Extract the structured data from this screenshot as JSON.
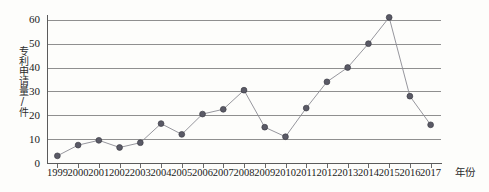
{
  "chart_data": {
    "type": "line",
    "title": "",
    "subtitle": "",
    "xlabel": "年份",
    "ylabel": "专利申请量/件",
    "categories": [
      "1999",
      "2000",
      "2001",
      "2002",
      "2003",
      "2004",
      "2005",
      "2006",
      "2007",
      "2008",
      "2009",
      "2010",
      "2011",
      "2012",
      "2013",
      "2014",
      "2015",
      "2016",
      "2017"
    ],
    "values": [
      3,
      7.5,
      9.5,
      6.5,
      8.5,
      16.5,
      12,
      20.5,
      22.5,
      30.5,
      15,
      11,
      23,
      34,
      40,
      50,
      61,
      28,
      16
    ],
    "ylim": [
      0,
      62
    ],
    "yticks": [
      0,
      10,
      20,
      30,
      40,
      50,
      60
    ],
    "ytick_labels": [
      "0",
      "10",
      "20",
      "30",
      "40",
      "50",
      "60"
    ],
    "grid": true,
    "grid_axis": "y",
    "legend": false,
    "legend_position": "none",
    "marker": "circle",
    "series": [
      {
        "name": "专利申请量",
        "values": [
          3,
          7.5,
          9.5,
          6.5,
          8.5,
          16.5,
          12,
          20.5,
          22.5,
          30.5,
          15,
          11,
          23,
          34,
          40,
          50,
          61,
          28,
          16
        ]
      }
    ],
    "colors": {
      "line": "#8a8a92",
      "marker": "#5a5a66",
      "marker_edge": "#3d3d46",
      "grid": "#8f8f8f",
      "axis": "#5b5b5b",
      "background": "#fdfdfb",
      "text": "#1a1a1a"
    }
  }
}
